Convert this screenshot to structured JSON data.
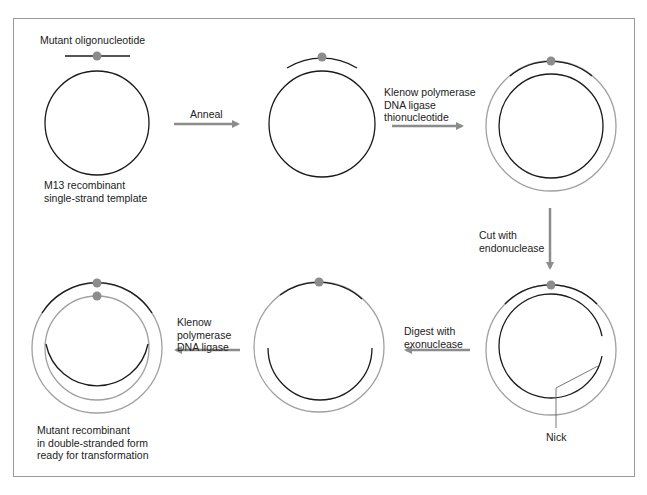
{
  "colors": {
    "template_strand": "#1a1a1a",
    "new_strand": "#a0a0a0",
    "mutation_dot": "#8c8c8c",
    "arrow": "#8c8c8c",
    "frame": "#9a9a9a"
  },
  "labels": {
    "oligo": "Mutant oligonucleotide",
    "template": "M13 recombinant\nsingle-strand template",
    "nick": "Nick",
    "final": "Mutant recombinant\nin double-stranded form\nready for transformation"
  },
  "steps": [
    {
      "id": "anneal",
      "label": "Anneal",
      "direction": "right"
    },
    {
      "id": "extend",
      "label": "Klenow polymerase\nDNA ligase\nthionucleotide",
      "direction": "right"
    },
    {
      "id": "cut",
      "label": "Cut with\nendonuclease",
      "direction": "down"
    },
    {
      "id": "digest",
      "label": "Digest with\nexonuclease",
      "direction": "left"
    },
    {
      "id": "repair",
      "label": "Klenow\npolymerase\nDNA ligase",
      "direction": "left"
    }
  ],
  "stages": [
    {
      "id": "stage-1",
      "description": "single-strand template plus mutant oligonucleotide"
    },
    {
      "id": "stage-2",
      "description": "oligonucleotide annealed to template"
    },
    {
      "id": "stage-3",
      "description": "complete double strand with thionucleotide-containing new strand"
    },
    {
      "id": "stage-4",
      "description": "template strand nicked by endonuclease"
    },
    {
      "id": "stage-5",
      "description": "template partially digested by exonuclease"
    },
    {
      "id": "stage-6",
      "description": "mutant double-stranded recombinant"
    }
  ]
}
